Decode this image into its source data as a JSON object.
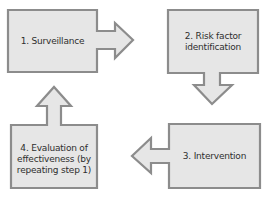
{
  "diagram": {
    "colors": {
      "fill": "#e6e6e6",
      "stroke": "#8c8c8c",
      "text": "#2e2e2e"
    },
    "steps": [
      {
        "id": 1,
        "label": "1. Surveillance"
      },
      {
        "id": 2,
        "label": "2. Risk factor\nidentification"
      },
      {
        "id": 3,
        "label": "3. Intervention"
      },
      {
        "id": 4,
        "label": "4. Evaluation of\neffectiveness (by\nrepeating step 1)"
      }
    ],
    "arrows": [
      {
        "from": 1,
        "to": 2,
        "direction": "right"
      },
      {
        "from": 2,
        "to": 3,
        "direction": "down"
      },
      {
        "from": 3,
        "to": 4,
        "direction": "left"
      },
      {
        "from": 4,
        "to": 1,
        "direction": "up"
      }
    ]
  }
}
